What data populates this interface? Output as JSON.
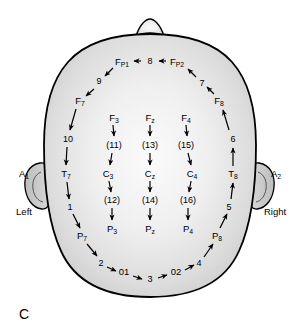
{
  "figure": {
    "panel_letter": "C",
    "title_hidden": "",
    "side_labels": {
      "left": "Left",
      "right": "Right"
    },
    "ear_labels": {
      "left": {
        "base": "A",
        "sub": "1"
      },
      "right": {
        "base": "A",
        "sub": "2"
      }
    }
  },
  "colors": {
    "head_fill_outer": "#cfcfcf",
    "head_fill_inner": "#f2f2f2",
    "outline": "#000000",
    "text": "#000000",
    "background": "#ffffff",
    "ear_fill": "#c8c8c8"
  },
  "electrodes": [
    {
      "id": "fp1",
      "base": "F",
      "sub": "P1",
      "x": 122,
      "y": 62
    },
    {
      "id": "fp2",
      "base": "F",
      "sub": "P2",
      "x": 177,
      "y": 62
    },
    {
      "id": "f7",
      "base": "F",
      "sub": "7",
      "x": 80,
      "y": 101
    },
    {
      "id": "f8",
      "base": "F",
      "sub": "8",
      "x": 219,
      "y": 101
    },
    {
      "id": "f3",
      "base": "F",
      "sub": "3",
      "x": 114,
      "y": 118
    },
    {
      "id": "fz",
      "base": "F",
      "sub": "z",
      "x": 150,
      "y": 118
    },
    {
      "id": "f4",
      "base": "F",
      "sub": "4",
      "x": 186,
      "y": 118
    },
    {
      "id": "t7",
      "base": "T",
      "sub": "7",
      "x": 66,
      "y": 174
    },
    {
      "id": "t8",
      "base": "T",
      "sub": "8",
      "x": 233,
      "y": 174
    },
    {
      "id": "c3",
      "base": "C",
      "sub": "3",
      "x": 108,
      "y": 174
    },
    {
      "id": "cz",
      "base": "C",
      "sub": "z",
      "x": 150,
      "y": 174
    },
    {
      "id": "c4",
      "base": "C",
      "sub": "4",
      "x": 192,
      "y": 174
    },
    {
      "id": "p7",
      "base": "P",
      "sub": "7",
      "x": 82,
      "y": 236
    },
    {
      "id": "p8",
      "base": "P",
      "sub": "8",
      "x": 217,
      "y": 236
    },
    {
      "id": "p3",
      "base": "P",
      "sub": "3",
      "x": 112,
      "y": 229
    },
    {
      "id": "pz",
      "base": "P",
      "sub": "z",
      "x": 150,
      "y": 229
    },
    {
      "id": "p4",
      "base": "P",
      "sub": "4",
      "x": 188,
      "y": 229
    },
    {
      "id": "o1",
      "base": "01",
      "sub": "",
      "x": 124,
      "y": 272
    },
    {
      "id": "o2",
      "base": "02",
      "sub": "",
      "x": 176,
      "y": 272
    }
  ],
  "sequence_numbers": [
    {
      "id": "n1",
      "label": "1",
      "x": 70,
      "y": 207
    },
    {
      "id": "n2",
      "label": "2",
      "x": 101,
      "y": 263
    },
    {
      "id": "n3",
      "label": "3",
      "x": 150,
      "y": 279
    },
    {
      "id": "n4",
      "label": "4",
      "x": 199,
      "y": 263
    },
    {
      "id": "n5",
      "label": "5",
      "x": 229,
      "y": 207
    },
    {
      "id": "n6",
      "label": "6",
      "x": 233,
      "y": 139
    },
    {
      "id": "n7",
      "label": "7",
      "x": 202,
      "y": 83
    },
    {
      "id": "n8",
      "label": "8",
      "x": 150,
      "y": 61
    },
    {
      "id": "n9",
      "label": "9",
      "x": 99,
      "y": 81
    },
    {
      "id": "n10",
      "label": "10",
      "x": 68,
      "y": 139
    }
  ],
  "bracket_numbers": [
    {
      "id": "b11",
      "label": "(11)",
      "x": 114,
      "y": 145
    },
    {
      "id": "b13",
      "label": "(13)",
      "x": 150,
      "y": 145
    },
    {
      "id": "b15",
      "label": "(15)",
      "x": 186,
      "y": 145
    },
    {
      "id": "b12",
      "label": "(12)",
      "x": 112,
      "y": 200
    },
    {
      "id": "b14",
      "label": "(14)",
      "x": 150,
      "y": 200
    },
    {
      "id": "b16",
      "label": "(16)",
      "x": 188,
      "y": 200
    }
  ],
  "diagram_meta": {
    "type": "eeg-10-20-electrode-placement",
    "view": "top-down-head",
    "orientation": "nose-at-top"
  }
}
